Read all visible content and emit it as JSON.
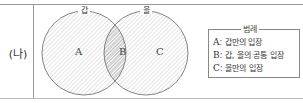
{
  "row_label": "(나)",
  "diagram": {
    "left_set_label": "갑",
    "right_set_label": "을",
    "regions": {
      "left_only": "A",
      "intersection": "B",
      "right_only": "C"
    }
  },
  "legend": {
    "title": "범례",
    "items": [
      {
        "key": "A",
        "text": ": 갑만의 입장"
      },
      {
        "key": "B",
        "text": ": 갑, 을의 공통 입장"
      },
      {
        "key": "C",
        "text": ": 을만의 입장"
      }
    ]
  }
}
